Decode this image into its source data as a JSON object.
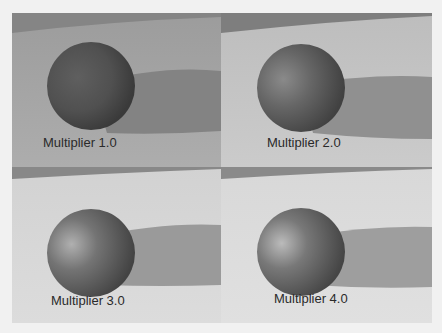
{
  "panels": [
    {
      "label": "Multiplier 1.0",
      "floor": "#a7a7a7",
      "sphere_dark": "#3e3e3e",
      "sphere_mid": "#5a5a5a",
      "sphere_light": "#6b6b6b",
      "shadow": "#7f7f7f",
      "band": "#8a8a8a"
    },
    {
      "label": "Multiplier 2.0",
      "floor": "#c6c6c6",
      "sphere_dark": "#474747",
      "sphere_mid": "#666666",
      "sphere_light": "#8a8a8a",
      "shadow": "#929292",
      "band": "#8e8e8e"
    },
    {
      "label": "Multiplier 3.0",
      "floor": "#d7d7d7",
      "sphere_dark": "#484848",
      "sphere_mid": "#6e6e6e",
      "sphere_light": "#a6a6a6",
      "shadow": "#9a9a9a",
      "band": "#929292"
    },
    {
      "label": "Multiplier 4.0",
      "floor": "#dddddd",
      "sphere_dark": "#4a4a4a",
      "sphere_mid": "#727272",
      "sphere_light": "#b4b4b4",
      "shadow": "#9e9e9e",
      "band": "#959595"
    }
  ]
}
